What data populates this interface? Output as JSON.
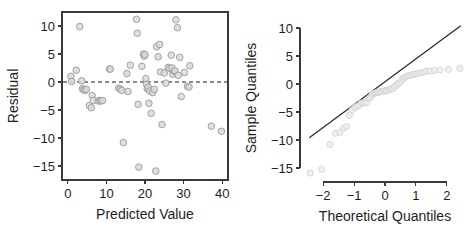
{
  "figure": {
    "panels": [
      "residual-plot",
      "qq-plot"
    ]
  },
  "chart_data": [
    {
      "type": "scatter",
      "id": "residual-plot",
      "title": "",
      "xlabel": "Predicted Value",
      "ylabel": "Residual",
      "xlim": [
        -1.5,
        41.5
      ],
      "ylim": [
        -17.5,
        12.5
      ],
      "xticks": [
        0,
        10,
        20,
        30,
        40
      ],
      "xtick_labels": [
        "0",
        "10",
        "20",
        "30",
        "40"
      ],
      "yticks": [
        10,
        5,
        0,
        -5,
        -10,
        -15
      ],
      "ytick_labels": [
        "10",
        "5",
        "0",
        "−5",
        "−10",
        "−15"
      ],
      "grid": false,
      "frame": "box",
      "legend": "none",
      "marker": "open-circle",
      "marker_color": "#d9d9d9",
      "marker_edge_color": "#9a9a9a",
      "reference_line": {
        "kind": "horizontal-dashed",
        "y": 0,
        "color": "#1a1a1a",
        "style": "dashed"
      },
      "x": [
        0.8,
        1.0,
        2.2,
        3.1,
        3.6,
        3.8,
        4.1,
        4.5,
        4.8,
        5.6,
        6.1,
        6.3,
        6.6,
        7.9,
        8.3,
        8.6,
        9.0,
        10.8,
        11.0,
        13.2,
        13.6,
        14.0,
        14.4,
        15.3,
        15.6,
        16.2,
        17.8,
        18.0,
        18.2,
        18.4,
        19.2,
        19.6,
        19.8,
        20.0,
        20.2,
        20.4,
        20.6,
        20.8,
        21.0,
        21.2,
        21.6,
        22.0,
        22.4,
        22.8,
        23.0,
        23.4,
        23.8,
        24.0,
        24.4,
        25.0,
        25.4,
        26.0,
        26.4,
        26.8,
        27.0,
        27.2,
        27.6,
        27.8,
        28.0,
        28.4,
        28.6,
        29.0,
        29.4,
        30.2,
        31.0,
        31.4,
        31.6,
        37.2,
        39.8
      ],
      "y": [
        1.0,
        0.1,
        2.1,
        9.9,
        0.2,
        -1.2,
        -1.4,
        -1.5,
        -1.3,
        -4.2,
        -4.6,
        -2.4,
        -3.3,
        -3.4,
        -3.3,
        -3.4,
        -3.3,
        2.3,
        2.3,
        -1.1,
        -1.3,
        -1.5,
        -10.8,
        1.5,
        -1.7,
        3.0,
        11.2,
        8.7,
        -4.0,
        -15.2,
        2.8,
        5.0,
        4.6,
        4.9,
        0.6,
        -0.4,
        -1.2,
        -0.9,
        -3.8,
        -1.6,
        -5.6,
        -1.9,
        -1.3,
        -15.9,
        6.3,
        4.5,
        6.7,
        1.8,
        -7.6,
        1.6,
        -0.2,
        2.6,
        2.4,
        4.8,
        2.5,
        1.4,
        1.9,
        2.0,
        11.1,
        9.7,
        1.2,
        4.4,
        -2.6,
        1.7,
        -0.8,
        -0.9,
        2.9,
        -7.9,
        -8.8
      ]
    },
    {
      "type": "scatter",
      "id": "qq-plot",
      "title": "",
      "xlabel": "Theoretical Quantiles",
      "ylabel": "Sample Quantiles",
      "xlim": [
        -2.75,
        2.75
      ],
      "ylim": [
        -17.5,
        12.5
      ],
      "xticks": [
        -2,
        -1,
        0,
        1,
        2
      ],
      "xtick_labels": [
        "−2",
        "−1",
        "0",
        "1",
        "2"
      ],
      "yticks": [
        10,
        5,
        0,
        -5,
        -10,
        -15
      ],
      "ytick_labels": [
        "10",
        "5",
        "0",
        "−5",
        "−10",
        "−15"
      ],
      "grid": false,
      "frame": "axes-only",
      "legend": "none",
      "marker": "open-circle",
      "marker_color": "#ececec",
      "marker_edge_color": "#cfcfcf",
      "reference_line": {
        "kind": "qq-line",
        "style": "solid",
        "color": "#2b2b2b",
        "x_start": -2.45,
        "y_start": -9.6,
        "x_end": 2.45,
        "y_end": 10.4
      },
      "x": [
        -2.42,
        -2.05,
        -1.78,
        -1.6,
        -1.46,
        -1.34,
        -1.24,
        -1.15,
        -1.06,
        -0.98,
        -0.91,
        -0.84,
        -0.77,
        -0.71,
        -0.65,
        -0.59,
        -0.53,
        -0.47,
        -0.42,
        -0.37,
        -0.31,
        -0.26,
        -0.21,
        -0.16,
        -0.11,
        -0.05,
        0.0,
        0.05,
        0.11,
        0.16,
        0.21,
        0.26,
        0.31,
        0.37,
        0.42,
        0.47,
        0.53,
        0.59,
        0.65,
        0.71,
        0.77,
        0.84,
        0.91,
        0.98,
        1.06,
        1.15,
        1.24,
        1.34,
        1.46,
        1.6,
        1.78,
        2.05,
        2.42
      ],
      "y": [
        -15.9,
        -15.2,
        -10.8,
        -8.8,
        -8.6,
        -7.9,
        -7.6,
        -5.6,
        -4.6,
        -4.2,
        -4.0,
        -3.8,
        -3.4,
        -3.4,
        -3.3,
        -3.3,
        -2.6,
        -2.4,
        -1.9,
        -1.7,
        -1.6,
        -1.5,
        -1.5,
        -1.4,
        -1.3,
        -1.3,
        -1.2,
        -1.2,
        -1.1,
        -0.9,
        -0.9,
        -0.8,
        -0.4,
        -0.2,
        0.1,
        0.2,
        0.6,
        1.0,
        1.2,
        1.4,
        1.5,
        1.6,
        1.7,
        1.8,
        1.9,
        2.0,
        2.1,
        2.3,
        2.3,
        2.4,
        2.5,
        2.6,
        2.8
      ]
    }
  ]
}
